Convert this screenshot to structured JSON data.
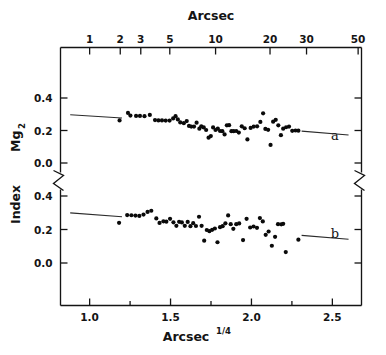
{
  "chart_data": {
    "type": "scatter",
    "title": "",
    "xlabel": "Arcsec^1/4",
    "xlabel_base": "Arcsec",
    "xlabel_exponent": "1/4",
    "top_axis_label": "Arcsec",
    "ylabel": "Mg2 Index",
    "ylabel_base": "Mg",
    "ylabel_sub": "2",
    "ylabel_tail": "Index",
    "broken_axis": true,
    "grid": false,
    "legend_position": "inline-right",
    "xlim": [
      0.82,
      2.68
    ],
    "x_ticks_major": [
      1.0,
      1.5,
      2.0,
      2.5
    ],
    "x_tick_labels": [
      "1.0",
      "1.5",
      "2.0",
      "2.5"
    ],
    "x_ticks_minor": [
      1.25,
      1.75,
      2.25
    ],
    "top_axis_scale": "log",
    "top_tick_values": [
      1,
      2,
      3,
      5,
      10,
      20,
      30,
      50
    ],
    "top_tick_labels": [
      "1",
      "2",
      "3",
      "5",
      "10",
      "20",
      "30",
      "50"
    ],
    "panels": [
      {
        "id": "a",
        "label": "a",
        "ylim": [
          -0.07,
          0.47
        ],
        "y_ticks": [
          0.0,
          0.2,
          0.4
        ],
        "y_tick_labels": [
          "0.0",
          "0.2",
          "0.4"
        ],
        "fit_line": {
          "x0": 0.88,
          "y0": 0.297,
          "x1": 1.2,
          "y1": 0.277
        },
        "fit_line_right": {
          "x0": 2.31,
          "y0": 0.196,
          "x1": 2.6,
          "y1": 0.172
        },
        "points": [
          [
            1.185,
            0.262
          ],
          [
            1.237,
            0.308
          ],
          [
            1.252,
            0.292
          ],
          [
            1.287,
            0.29
          ],
          [
            1.311,
            0.29
          ],
          [
            1.339,
            0.288
          ],
          [
            1.372,
            0.296
          ],
          [
            1.404,
            0.264
          ],
          [
            1.425,
            0.262
          ],
          [
            1.447,
            0.262
          ],
          [
            1.47,
            0.261
          ],
          [
            1.494,
            0.261
          ],
          [
            1.516,
            0.274
          ],
          [
            1.531,
            0.288
          ],
          [
            1.545,
            0.268
          ],
          [
            1.56,
            0.25
          ],
          [
            1.582,
            0.245
          ],
          [
            1.6,
            0.258
          ],
          [
            1.614,
            0.228
          ],
          [
            1.628,
            0.224
          ],
          [
            1.645,
            0.224
          ],
          [
            1.661,
            0.248
          ],
          [
            1.678,
            0.211
          ],
          [
            1.69,
            0.226
          ],
          [
            1.705,
            0.219
          ],
          [
            1.72,
            0.203
          ],
          [
            1.735,
            0.156
          ],
          [
            1.749,
            0.166
          ],
          [
            1.763,
            0.219
          ],
          [
            1.778,
            0.203
          ],
          [
            1.792,
            0.212
          ],
          [
            1.806,
            0.197
          ],
          [
            1.82,
            0.196
          ],
          [
            1.834,
            0.176
          ],
          [
            1.848,
            0.232
          ],
          [
            1.862,
            0.233
          ],
          [
            1.876,
            0.196
          ],
          [
            1.89,
            0.196
          ],
          [
            1.906,
            0.197
          ],
          [
            1.922,
            0.187
          ],
          [
            1.94,
            0.226
          ],
          [
            1.958,
            0.214
          ],
          [
            1.975,
            0.145
          ],
          [
            1.995,
            0.216
          ],
          [
            2.014,
            0.224
          ],
          [
            2.035,
            0.226
          ],
          [
            2.055,
            0.253
          ],
          [
            2.072,
            0.306
          ],
          [
            2.086,
            0.21
          ],
          [
            2.103,
            0.204
          ],
          [
            2.118,
            0.111
          ],
          [
            2.134,
            0.254
          ],
          [
            2.15,
            0.266
          ],
          [
            2.166,
            0.232
          ],
          [
            2.182,
            0.171
          ],
          [
            2.196,
            0.211
          ],
          [
            2.214,
            0.22
          ],
          [
            2.232,
            0.224
          ],
          [
            2.252,
            0.198
          ],
          [
            2.272,
            0.2
          ],
          [
            2.29,
            0.199
          ]
        ]
      },
      {
        "id": "b",
        "label": "b",
        "ylim": [
          -0.07,
          0.47
        ],
        "y_ticks": [
          0.0,
          0.2,
          0.4
        ],
        "y_tick_labels": [
          "0.0",
          "0.2",
          "0.4"
        ],
        "fit_line": {
          "x0": 0.88,
          "y0": 0.299,
          "x1": 1.2,
          "y1": 0.276
        },
        "fit_line_right": {
          "x0": 2.31,
          "y0": 0.165,
          "x1": 2.6,
          "y1": 0.142
        },
        "points": [
          [
            1.182,
            0.24
          ],
          [
            1.232,
            0.286
          ],
          [
            1.258,
            0.285
          ],
          [
            1.283,
            0.283
          ],
          [
            1.307,
            0.281
          ],
          [
            1.333,
            0.289
          ],
          [
            1.358,
            0.305
          ],
          [
            1.381,
            0.312
          ],
          [
            1.412,
            0.266
          ],
          [
            1.432,
            0.239
          ],
          [
            1.456,
            0.249
          ],
          [
            1.474,
            0.247
          ],
          [
            1.497,
            0.264
          ],
          [
            1.518,
            0.243
          ],
          [
            1.536,
            0.222
          ],
          [
            1.553,
            0.246
          ],
          [
            1.57,
            0.242
          ],
          [
            1.588,
            0.222
          ],
          [
            1.606,
            0.245
          ],
          [
            1.623,
            0.22
          ],
          [
            1.64,
            0.238
          ],
          [
            1.657,
            0.221
          ],
          [
            1.676,
            0.276
          ],
          [
            1.692,
            0.222
          ],
          [
            1.708,
            0.133
          ],
          [
            1.724,
            0.197
          ],
          [
            1.74,
            0.19
          ],
          [
            1.757,
            0.198
          ],
          [
            1.774,
            0.206
          ],
          [
            1.79,
            0.124
          ],
          [
            1.806,
            0.214
          ],
          [
            1.822,
            0.22
          ],
          [
            1.839,
            0.237
          ],
          [
            1.856,
            0.284
          ],
          [
            1.872,
            0.232
          ],
          [
            1.888,
            0.204
          ],
          [
            1.906,
            0.232
          ],
          [
            1.924,
            0.236
          ],
          [
            1.948,
            0.137
          ],
          [
            1.97,
            0.264
          ],
          [
            1.992,
            0.212
          ],
          [
            2.013,
            0.218
          ],
          [
            2.034,
            0.21
          ],
          [
            2.052,
            0.268
          ],
          [
            2.07,
            0.248
          ],
          [
            2.088,
            0.168
          ],
          [
            2.106,
            0.188
          ],
          [
            2.126,
            0.103
          ],
          [
            2.146,
            0.156
          ],
          [
            2.164,
            0.232
          ],
          [
            2.184,
            0.231
          ],
          [
            2.196,
            0.234
          ],
          [
            2.212,
            0.065
          ],
          [
            2.29,
            0.139
          ]
        ]
      }
    ]
  },
  "style": {
    "axis_color": "#141414",
    "point_color": "#0a0a0a",
    "line_color": "#2b2b2b",
    "background": "#ffffff",
    "point_radius": 2.1
  }
}
